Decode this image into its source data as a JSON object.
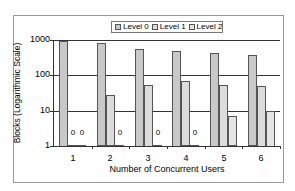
{
  "chart_data": {
    "type": "bar",
    "title": "",
    "xlabel": "Number of Concurrent Users",
    "ylabel": "Blocks (Logarithmic Scale)",
    "yscale": "log",
    "ylim": [
      1,
      1000
    ],
    "yticks": [
      "1",
      "10",
      "100",
      "1000"
    ],
    "categories": [
      "1",
      "2",
      "3",
      "4",
      "5",
      "6"
    ],
    "series": [
      {
        "name": "Level 0",
        "values": [
          950,
          800,
          570,
          500,
          430,
          370
        ],
        "color": "#c8c8c8"
      },
      {
        "name": "Level 1",
        "values": [
          1,
          27,
          55,
          68,
          55,
          50
        ],
        "color": "#dcdcdc"
      },
      {
        "name": "Level 2",
        "values": [
          1,
          1,
          1,
          1,
          7,
          10
        ],
        "color": "#e4e4e4"
      }
    ],
    "annotations": [
      {
        "category": "1",
        "series": "Level 1",
        "text": "0"
      },
      {
        "category": "1",
        "series": "Level 2",
        "text": "0"
      },
      {
        "category": "2",
        "series": "Level 2",
        "text": "0"
      },
      {
        "category": "3",
        "series": "Level 2",
        "text": "0"
      },
      {
        "category": "4",
        "series": "Level 2",
        "text": "0"
      }
    ],
    "legend_position": "top",
    "grid": true
  },
  "legend": [
    "Level 0",
    "Level 1",
    "Level 2"
  ],
  "zero_label": "0"
}
